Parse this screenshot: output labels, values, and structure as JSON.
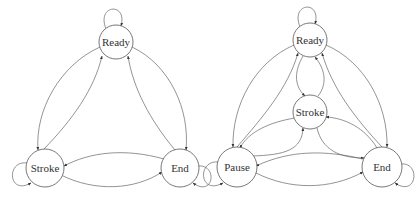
{
  "diagrams": [
    {
      "id": "left",
      "nodes": [
        {
          "id": "ready",
          "label": "Ready",
          "x": 116,
          "y": 42,
          "r": 17
        },
        {
          "id": "stroke",
          "label": "Stroke",
          "x": 45,
          "y": 168,
          "r": 19
        },
        {
          "id": "end",
          "label": "End",
          "x": 180,
          "y": 168,
          "r": 19
        }
      ],
      "edges": [
        {
          "from": "ready",
          "to": "ready",
          "type": "self-loop"
        },
        {
          "from": "stroke",
          "to": "stroke",
          "type": "self-loop"
        },
        {
          "from": "end",
          "to": "end",
          "type": "self-loop"
        },
        {
          "from": "ready",
          "to": "stroke"
        },
        {
          "from": "stroke",
          "to": "ready"
        },
        {
          "from": "ready",
          "to": "end"
        },
        {
          "from": "end",
          "to": "ready"
        },
        {
          "from": "stroke",
          "to": "end"
        },
        {
          "from": "end",
          "to": "stroke"
        }
      ]
    },
    {
      "id": "right",
      "nodes": [
        {
          "id": "ready",
          "label": "Ready",
          "x": 310,
          "y": 40,
          "r": 17
        },
        {
          "id": "stroke",
          "label": "Stroke",
          "x": 310,
          "y": 112,
          "r": 17
        },
        {
          "id": "pause",
          "label": "Pause",
          "x": 237,
          "y": 167,
          "r": 20
        },
        {
          "id": "end",
          "label": "End",
          "x": 382,
          "y": 167,
          "r": 20
        }
      ],
      "edges": [
        {
          "from": "ready",
          "to": "ready",
          "type": "self-loop"
        },
        {
          "from": "pause",
          "to": "pause",
          "type": "self-loop"
        },
        {
          "from": "end",
          "to": "end",
          "type": "self-loop"
        },
        {
          "from": "ready",
          "to": "stroke"
        },
        {
          "from": "stroke",
          "to": "ready"
        },
        {
          "from": "ready",
          "to": "pause"
        },
        {
          "from": "pause",
          "to": "ready"
        },
        {
          "from": "ready",
          "to": "end"
        },
        {
          "from": "end",
          "to": "ready"
        },
        {
          "from": "stroke",
          "to": "pause"
        },
        {
          "from": "pause",
          "to": "stroke"
        },
        {
          "from": "stroke",
          "to": "end"
        },
        {
          "from": "end",
          "to": "stroke"
        },
        {
          "from": "pause",
          "to": "end"
        },
        {
          "from": "end",
          "to": "pause"
        }
      ]
    }
  ]
}
